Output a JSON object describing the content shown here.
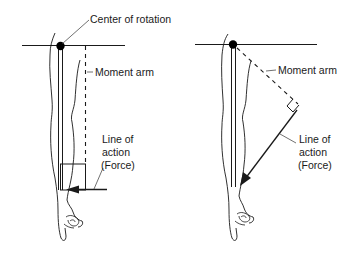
{
  "diagram": {
    "left_panel": {
      "title": "Arm vertical, force perpendicular",
      "labels": {
        "center_of_rotation": "Center of rotation",
        "moment_arm": "Moment arm",
        "line_of_action_1": "Line of",
        "line_of_action_2": "action",
        "line_of_action_3": "(Force)"
      }
    },
    "right_panel": {
      "title": "Arm vertical, force angled",
      "labels": {
        "moment_arm": "Moment arm",
        "line_of_action_1": "Line of",
        "line_of_action_2": "action",
        "line_of_action_3": "(Force)"
      }
    },
    "colors": {
      "line": "#1a1a1a",
      "leader": "#444444",
      "background": "#ffffff"
    }
  }
}
